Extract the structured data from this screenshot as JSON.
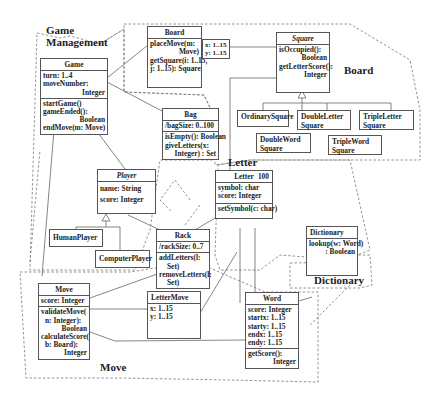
{
  "diagram_type": "UML class diagram",
  "packages": [
    {
      "name": "Game Management",
      "label_lines": [
        "Game",
        "Management"
      ]
    },
    {
      "name": "Board",
      "label": "Board"
    },
    {
      "name": "Letter",
      "label": "Letter"
    },
    {
      "name": "Dictionary",
      "label": "Dictionary"
    },
    {
      "name": "Move",
      "label": "Move"
    }
  ],
  "classes": {
    "game": {
      "name": "Game",
      "attributes": [
        "turn: 1..4",
        "moveNumber:",
        "Integer"
      ],
      "operations": [
        "startGame()",
        "gameEnded():",
        "Boolean",
        "endMove(m: Move)"
      ]
    },
    "board": {
      "name": "Board",
      "operations": [
        "placeMove(m:",
        "Move)",
        "getSquare(i: 1..15,",
        "j: 1..15): Square"
      ]
    },
    "board_qualifier": {
      "lines": [
        "x: 1..15",
        "y: 1..15"
      ]
    },
    "square": {
      "name": "Square",
      "operations": [
        "isOccupied():",
        "Boolean",
        "getLetterScore():",
        "Integer"
      ]
    },
    "ordinary_square": {
      "name": "OrdinarySquare"
    },
    "double_letter_square": {
      "name_lines": [
        "DoubleLetter",
        "Square"
      ]
    },
    "triple_letter_square": {
      "name_lines": [
        "TripleLetter",
        "Square"
      ]
    },
    "double_word_square": {
      "name_lines": [
        "DoubleWord",
        "Square"
      ]
    },
    "triple_word_square": {
      "name_lines": [
        "TripleWord",
        "Square"
      ]
    },
    "bag": {
      "name": "Bag",
      "attributes": [
        "/bagSize: 0..100"
      ],
      "operations": [
        "isEmpty(): Boolean",
        "giveLetters(x:",
        "Integer) : Set"
      ]
    },
    "player": {
      "name": "Player",
      "attributes": [
        "name: String",
        "score: Integer"
      ]
    },
    "human_player": {
      "name": "HumanPlayer"
    },
    "computer_player": {
      "name": "ComputerPlayer"
    },
    "letter": {
      "name": "Letter",
      "multiplicity": "100",
      "attributes": [
        "symbol: char",
        "score: Integer"
      ],
      "operations": [
        "setSymbol(c: char)"
      ]
    },
    "rack": {
      "name": "Rack",
      "attributes": [
        "/rackSize: 0..7"
      ],
      "operations": [
        "addLetters(l:",
        "Set)",
        "removeLetters(l:",
        "Set)"
      ]
    },
    "dictionary": {
      "name": "Dictionary",
      "operations": [
        "lookup(w: Word)",
        ": Boolean"
      ]
    },
    "move": {
      "name": "Move",
      "attributes": [
        "score: Integer"
      ],
      "operations": [
        "validateMove(",
        "n: Integer):",
        "Boolean",
        "calculateScore(",
        "b: Board):",
        "Integer"
      ]
    },
    "letter_move": {
      "name": "LetterMove",
      "attributes": [
        "x: 1..15",
        "y: 1..15"
      ]
    },
    "word": {
      "name": "Word",
      "attributes": [
        "score: Integer",
        "startx: 1..15",
        "starty: 1..15",
        "endx: 1..15",
        "endy: 1..15"
      ],
      "operations": [
        "getScore():",
        "Integer"
      ]
    }
  }
}
